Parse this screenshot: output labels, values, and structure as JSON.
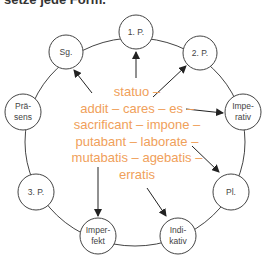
{
  "header": {
    "text": "setze jede Form."
  },
  "colors": {
    "accent": "#f0a05a",
    "stroke": "#444444"
  },
  "nodes": [
    {
      "id": "1p",
      "label": "1. P.",
      "x": 136,
      "y": 32
    },
    {
      "id": "2p",
      "label": "2. P.",
      "x": 200,
      "y": 53
    },
    {
      "id": "imperativ",
      "label": "Impe-\nrativ",
      "x": 243,
      "y": 112
    },
    {
      "id": "pl",
      "label": "Pl.",
      "x": 231,
      "y": 192
    },
    {
      "id": "indikativ",
      "label": "Indi-\nkativ",
      "x": 178,
      "y": 236
    },
    {
      "id": "imperfekt",
      "label": "Imper-\nfekt",
      "x": 98,
      "y": 236
    },
    {
      "id": "3p",
      "label": "3. P.",
      "x": 36,
      "y": 192
    },
    {
      "id": "praesens",
      "label": "Prä-\nsens",
      "x": 23,
      "y": 112
    },
    {
      "id": "sg",
      "label": "Sg.",
      "x": 66,
      "y": 52
    }
  ],
  "center": {
    "lines": [
      "statuo –",
      "addit – cares – es –",
      "sacrificant – impone –",
      "putabant – laborate –",
      "mutabatis – agebatis –",
      "erratis"
    ]
  }
}
